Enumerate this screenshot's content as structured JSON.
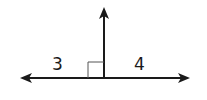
{
  "diagram": {
    "labels": {
      "left_angle": "3",
      "right_angle": "4"
    },
    "colors": {
      "stroke": "#1a1a1a",
      "background": "#ffffff"
    }
  }
}
